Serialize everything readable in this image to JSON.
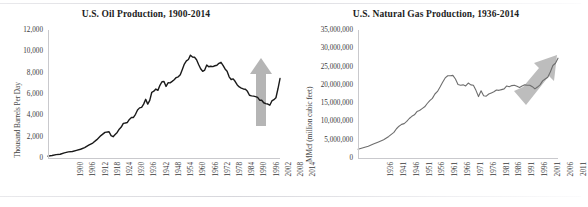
{
  "page": {
    "background": "#ffffff",
    "figure_caption": "",
    "rule_color": "#d7d7dc"
  },
  "chart_data": [
    {
      "id": "us-oil-production",
      "type": "line",
      "title": "U.S. Oil Production, 1900-2014",
      "xlabel": "",
      "ylabel": "Thousand Barrels Per Day",
      "ylim": [
        0,
        12000
      ],
      "xlim": [
        1900,
        2014
      ],
      "grid": false,
      "legend": false,
      "line_color": "#1a1a1a",
      "annotation": {
        "name": "growth-arrow",
        "direction": "up",
        "color": "#b3b3b3",
        "period": "2008-2014"
      },
      "ytick_labels": [
        "0",
        "2,000",
        "4,000",
        "6,000",
        "8,000",
        "10,000",
        "12,000"
      ],
      "ytick_values": [
        0,
        2000,
        4000,
        6000,
        8000,
        10000,
        12000
      ],
      "xtick_labels": [
        "1900",
        "1906",
        "1912",
        "1918",
        "1924",
        "1930",
        "1936",
        "1942",
        "1948",
        "1954",
        "1960",
        "1966",
        "1972",
        "1978",
        "1984",
        "1990",
        "1996",
        "2002",
        "2008",
        "2014"
      ],
      "xtick_values": [
        1900,
        1906,
        1912,
        1918,
        1924,
        1930,
        1936,
        1942,
        1948,
        1954,
        1960,
        1966,
        1972,
        1978,
        1984,
        1990,
        1996,
        2002,
        2008,
        2014
      ],
      "x": [
        1900,
        1902,
        1904,
        1906,
        1908,
        1910,
        1912,
        1914,
        1916,
        1918,
        1920,
        1922,
        1924,
        1926,
        1928,
        1930,
        1931,
        1932,
        1933,
        1934,
        1935,
        1936,
        1937,
        1938,
        1939,
        1940,
        1941,
        1942,
        1943,
        1944,
        1945,
        1946,
        1947,
        1948,
        1949,
        1950,
        1951,
        1952,
        1953,
        1954,
        1955,
        1956,
        1957,
        1958,
        1959,
        1960,
        1961,
        1962,
        1963,
        1964,
        1965,
        1966,
        1967,
        1968,
        1969,
        1970,
        1971,
        1972,
        1973,
        1974,
        1975,
        1976,
        1977,
        1978,
        1979,
        1980,
        1981,
        1982,
        1983,
        1984,
        1985,
        1986,
        1987,
        1988,
        1989,
        1990,
        1991,
        1992,
        1993,
        1994,
        1995,
        1996,
        1997,
        1998,
        1999,
        2000,
        2001,
        2002,
        2003,
        2004,
        2005,
        2006,
        2007,
        2008,
        2009,
        2010,
        2011,
        2012,
        2013,
        2014
      ],
      "y": [
        174,
        240,
        320,
        350,
        480,
        570,
        610,
        720,
        820,
        980,
        1200,
        1400,
        1720,
        2100,
        2400,
        2460,
        2100,
        2000,
        2200,
        2400,
        2700,
        2900,
        3250,
        3280,
        3330,
        3620,
        3800,
        3800,
        4100,
        4500,
        4700,
        4750,
        5050,
        5500,
        5050,
        5400,
        6160,
        6260,
        6460,
        6340,
        6810,
        7150,
        7170,
        6710,
        7050,
        7040,
        7180,
        7330,
        7540,
        7610,
        7800,
        8300,
        8810,
        9100,
        9240,
        9640,
        9460,
        9440,
        9210,
        8770,
        8370,
        8130,
        8240,
        8710,
        8550,
        8600,
        8570,
        8650,
        8690,
        8880,
        8970,
        8680,
        8350,
        8140,
        7610,
        7360,
        7420,
        7170,
        6850,
        6660,
        6560,
        6470,
        6450,
        6250,
        5880,
        5820,
        5800,
        5750,
        5680,
        5420,
        5420,
        5180,
        5100,
        5060,
        4950,
        5350,
        5470,
        5650,
        6490,
        7450,
        8650
      ]
    },
    {
      "id": "us-natural-gas-production",
      "type": "line",
      "title": "U.S. Natural Gas Production, 1936-2014",
      "xlabel": "",
      "ylabel": "MMcf (million cubic feet)",
      "ylim": [
        0,
        35000000
      ],
      "xlim": [
        1936,
        2014
      ],
      "grid": false,
      "legend": false,
      "line_color": "#6e6e6e",
      "annotation": {
        "name": "growth-arrow",
        "direction": "up-right",
        "color": "#b8b8b8",
        "period": "2006-2014"
      },
      "ytick_labels": [
        "0",
        "5,000,000",
        "10,000,000",
        "15,000,000",
        "20,000,000",
        "25,000,000",
        "30,000,000",
        "35,000,000"
      ],
      "ytick_values": [
        0,
        5000000,
        10000000,
        15000000,
        20000000,
        25000000,
        30000000,
        35000000
      ],
      "xtick_labels": [
        "1936",
        "1941",
        "1946",
        "1951",
        "1956",
        "1961",
        "1966",
        "1971",
        "1976",
        "1981",
        "1986",
        "1991",
        "1996",
        "2001",
        "2006",
        "2011"
      ],
      "xtick_values": [
        1936,
        1941,
        1946,
        1951,
        1956,
        1961,
        1966,
        1971,
        1976,
        1981,
        1986,
        1991,
        1996,
        2001,
        2006,
        2011
      ],
      "x": [
        1936,
        1938,
        1940,
        1942,
        1944,
        1946,
        1948,
        1950,
        1951,
        1952,
        1953,
        1954,
        1955,
        1956,
        1957,
        1958,
        1959,
        1960,
        1961,
        1962,
        1963,
        1964,
        1965,
        1966,
        1967,
        1968,
        1969,
        1970,
        1971,
        1972,
        1973,
        1974,
        1975,
        1976,
        1977,
        1978,
        1979,
        1980,
        1981,
        1982,
        1983,
        1984,
        1985,
        1986,
        1987,
        1988,
        1989,
        1990,
        1991,
        1992,
        1993,
        1994,
        1995,
        1996,
        1997,
        1998,
        1999,
        2000,
        2001,
        2002,
        2003,
        2004,
        2005,
        2006,
        2007,
        2008,
        2009,
        2010,
        2011,
        2012,
        2013,
        2014
      ],
      "y": [
        2400000,
        2800000,
        3200000,
        3800000,
        4400000,
        5000000,
        5900000,
        7000000,
        8000000,
        8700000,
        9200000,
        9400000,
        10000000,
        10800000,
        11400000,
        11800000,
        12700000,
        13000000,
        13500000,
        14000000,
        14900000,
        15700000,
        16300000,
        17500000,
        18200000,
        19400000,
        20700000,
        21900000,
        22500000,
        22500000,
        22600000,
        21600000,
        20100000,
        19900000,
        20000000,
        19700000,
        20500000,
        20000000,
        19900000,
        18500000,
        16800000,
        18400000,
        17000000,
        16900000,
        17500000,
        17800000,
        18100000,
        18600000,
        18500000,
        18700000,
        18900000,
        19700000,
        19500000,
        19800000,
        19900000,
        19600000,
        19300000,
        19700000,
        20000000,
        19900000,
        19900000,
        19500000,
        18900000,
        19400000,
        20000000,
        21100000,
        21600000,
        22100000,
        23500000,
        25300000,
        25900000,
        27300000
      ]
    }
  ]
}
